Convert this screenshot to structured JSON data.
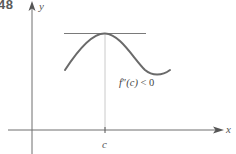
{
  "figure": {
    "number": "48",
    "x_axis_label": "x",
    "y_axis_label": "y",
    "point_label": "c",
    "annotation": {
      "func": "f",
      "primes": "″",
      "arg": "(c)",
      "relation": " < 0"
    },
    "colors": {
      "axis": "#6e6e6e",
      "curve": "#6a6a6a",
      "tangent": "#7a7a7a",
      "guide": "#bdbdbd",
      "text": "#4a4a4a"
    }
  }
}
